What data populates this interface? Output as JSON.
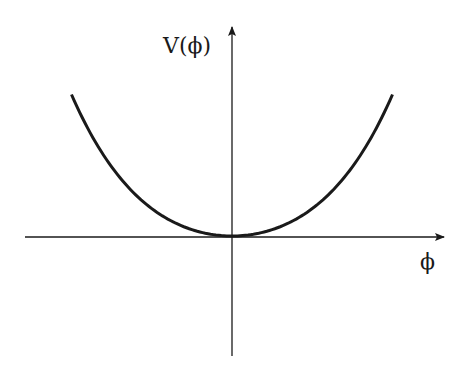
{
  "diagram": {
    "y_axis_label": "V(ϕ)",
    "x_axis_label": "ϕ",
    "curve": {
      "description": "Symmetric potential with single minimum at phi = 0",
      "phi_range": [
        -1,
        1
      ],
      "quadratic_weight": 0.7,
      "quartic_weight": 0.3,
      "minimum": {
        "phi": 0,
        "V": 0
      }
    },
    "colors": {
      "ink": "#1a1a1a",
      "background": "#ffffff"
    }
  }
}
